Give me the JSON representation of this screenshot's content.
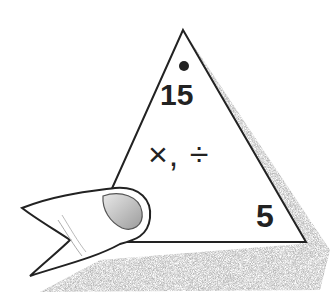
{
  "card": {
    "top_number": "15",
    "operations": "×, ÷",
    "corner_number": "5",
    "marker": "dot"
  },
  "colors": {
    "outline": "#222222",
    "shadow": "#9a9a9a",
    "skin_shade": "#bdbdbd"
  }
}
